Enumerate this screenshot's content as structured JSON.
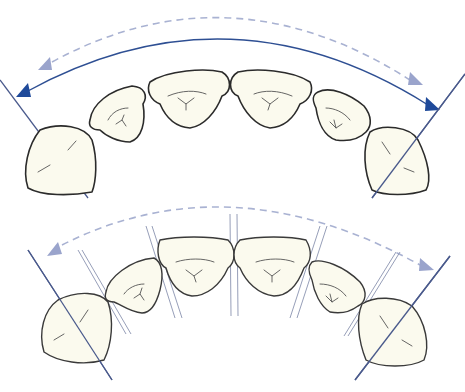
{
  "figure": {
    "panels": [
      {
        "id": "top",
        "description": "upper arch with solid blue arc arrow and dashed light-blue arc arrow between molar axes"
      },
      {
        "id": "bottom",
        "description": "upper arch with contact-point parallel guide lines and dashed light-blue arc arrow"
      }
    ],
    "colors": {
      "solid_arrow": "#2e4f93",
      "solid_arrowhead": "#1f4a9a",
      "dashed_arrow": "#a9b2d2",
      "dashed_arrowhead": "#9aa4cc",
      "axis_line": "#4a5a8c",
      "guide_line": "#8a93b0",
      "tooth_fill": "#fbfaee",
      "tooth_outline": "#2b2b2b"
    }
  }
}
